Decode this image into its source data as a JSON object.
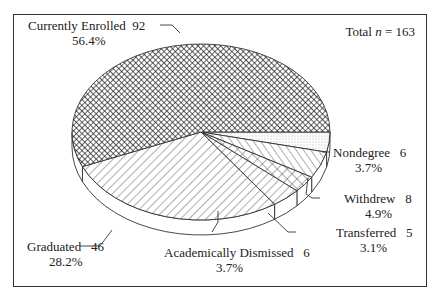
{
  "chart_data": {
    "type": "pie",
    "style": "3d-exploded-none, black-and-white hatch patterns",
    "title": "",
    "annotation": "Total n = 163",
    "total_n": 163,
    "categories": [
      "Currently Enrolled",
      "Graduated",
      "Academically Dismissed",
      "Transferred",
      "Withdrew",
      "Nondegree"
    ],
    "values": [
      92,
      46,
      6,
      5,
      8,
      6
    ],
    "percentages": [
      56.4,
      28.2,
      3.7,
      3.1,
      4.9,
      3.7
    ],
    "patterns": [
      "crosshatch-dense",
      "diagonal-lines",
      "diagonal-crosshatch",
      "diagonal-lines-opposite",
      "diagonal-lines-opposite",
      "dotted"
    ],
    "legend": "none (direct labels with leader lines)"
  },
  "labels": {
    "total_prefix": "Total ",
    "total_n_symbol": "n",
    "total_suffix": " = 163",
    "enrolled": {
      "name": "Currently Enrolled",
      "count": "92",
      "pct": "56.4%"
    },
    "graduated": {
      "name": "Graduated",
      "count": "46",
      "pct": "28.2%"
    },
    "dismissed": {
      "name": "Academically Dismissed",
      "count": "6",
      "pct": "3.7%"
    },
    "transferred": {
      "name": "Transferred",
      "count": "5",
      "pct": "3.1%"
    },
    "withdrew": {
      "name": "Withdrew",
      "count": "8",
      "pct": "4.9%"
    },
    "nondegree": {
      "name": "Nondegree",
      "count": "6",
      "pct": "3.7%"
    }
  }
}
